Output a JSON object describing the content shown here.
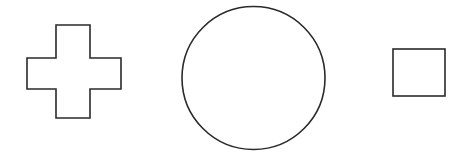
{
  "diagram": {
    "shapes": [
      {
        "type": "cross",
        "name": "cross-shape",
        "stroke": "#2a2a2a",
        "fill": "#ffffff"
      },
      {
        "type": "circle",
        "name": "circle-shape",
        "stroke": "#2a2a2a",
        "fill": "#ffffff"
      },
      {
        "type": "square",
        "name": "square-shape",
        "stroke": "#2a2a2a",
        "fill": "#ffffff"
      }
    ]
  }
}
